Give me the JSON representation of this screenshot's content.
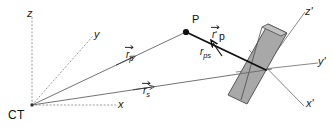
{
  "figure": {
    "background_color": "#ffffff",
    "line_color": "#6b6b6b",
    "bold_line_color": "#111111",
    "dotted_axis_color": "#9a9a9a",
    "plate_fill_color": "#a8a8a8",
    "plate_edge_color": "#4a4a4a",
    "plate_top_fill_color": "#bdbdbd"
  },
  "labels": {
    "origin": "CT",
    "point_p": "P",
    "axis_z": "z",
    "axis_y": "y",
    "axis_x": "x",
    "axis_z_prime": "z'",
    "axis_y_prime": "y'",
    "axis_x_prime": "x'"
  },
  "vectors": [
    {
      "id": "r-p",
      "base": "r",
      "prime": "",
      "subscript": "p",
      "description": "vector from CT origin to point P"
    },
    {
      "id": "r-s",
      "base": "r",
      "prime": "",
      "subscript": "s",
      "description": "vector from CT origin to detector source point"
    },
    {
      "id": "r-p-prime",
      "base": "r",
      "prime": "'",
      "subscript": "p",
      "description": "primed vector from detector frame to point P"
    },
    {
      "id": "r-ps",
      "base": "r",
      "prime": "",
      "subscript": "ps",
      "description": "vector from detector intersection back toward P"
    }
  ]
}
